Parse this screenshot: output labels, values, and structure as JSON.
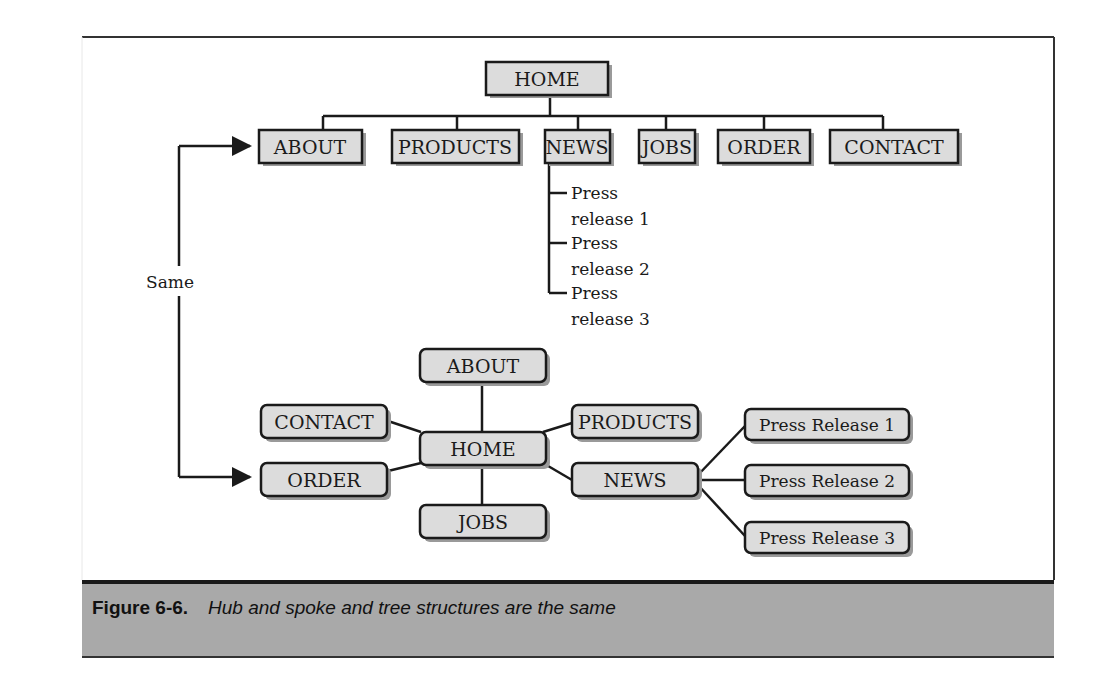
{
  "figure": {
    "label": "Figure 6-6.",
    "caption": "Hub and spoke and tree structures are the same"
  },
  "connector": {
    "label": "Same"
  },
  "tree": {
    "root": {
      "label": "HOME"
    },
    "children": [
      {
        "label": "ABOUT"
      },
      {
        "label": "PRODUCTS"
      },
      {
        "label": "NEWS"
      },
      {
        "label": "JOBS"
      },
      {
        "label": "ORDER"
      },
      {
        "label": "CONTACT"
      }
    ],
    "news_items": [
      {
        "line1": "Press",
        "line2": "release 1"
      },
      {
        "line1": "Press",
        "line2": "release 2"
      },
      {
        "line1": "Press",
        "line2": "release 3"
      }
    ]
  },
  "hub": {
    "center": {
      "label": "HOME"
    },
    "spokes": {
      "about": "ABOUT",
      "contact": "CONTACT",
      "order": "ORDER",
      "products": "PRODUCTS",
      "news": "NEWS",
      "jobs": "JOBS"
    },
    "news_items": [
      "Press Release 1",
      "Press Release 2",
      "Press Release 3"
    ]
  },
  "colors": {
    "box_fill": "#dcdcdc",
    "box_stroke": "#1a1a1a",
    "shadow": "#9a9a9a",
    "caption_band": "#a9a9a9"
  }
}
